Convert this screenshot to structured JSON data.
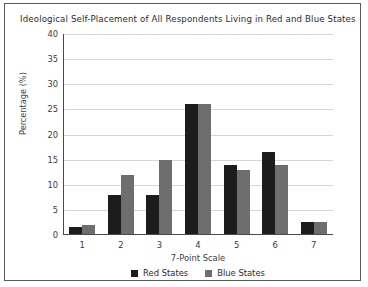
{
  "figure": {
    "border_color": "#5a5a5a",
    "background": "#ffffff"
  },
  "chart_data": {
    "type": "bar",
    "title": "Ideological Self-Placement of All Respondents Living in Red and Blue States",
    "xlabel": "7-Point Scale",
    "ylabel": "Percentage (%)",
    "categories": [
      "1",
      "2",
      "3",
      "4",
      "5",
      "6",
      "7"
    ],
    "ylim": [
      0,
      40
    ],
    "yticks": [
      0,
      5,
      10,
      15,
      20,
      25,
      30,
      35,
      40
    ],
    "ytick_labels": [
      "0",
      "5",
      "10",
      "15",
      "20",
      "25",
      "30",
      "35",
      "40"
    ],
    "grid": true,
    "grid_axis": "y",
    "legend_position": "bottom-center",
    "series": [
      {
        "name": "Red States",
        "color": "#1c1c1c",
        "values": [
          1.5,
          8,
          8,
          26,
          14,
          16.5,
          2.5
        ]
      },
      {
        "name": "Blue States",
        "color": "#6e6e6e",
        "values": [
          2,
          12,
          15,
          26,
          13,
          14,
          2.5
        ]
      }
    ]
  }
}
